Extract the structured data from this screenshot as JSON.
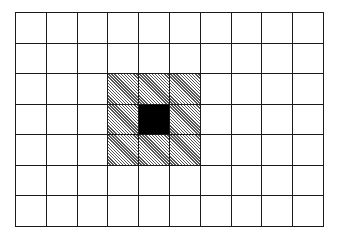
{
  "diagram": {
    "type": "grid",
    "columns": 10,
    "rows": 7,
    "line_color": "#1a1a1a",
    "background_color": "#ffffff",
    "filled_color": "#000000",
    "hatch_color": "#555555",
    "filled_cells": [
      {
        "row": 3,
        "col": 4
      }
    ],
    "hatched_cells": [
      {
        "row": 2,
        "col": 3
      },
      {
        "row": 2,
        "col": 4
      },
      {
        "row": 2,
        "col": 5
      },
      {
        "row": 3,
        "col": 3
      },
      {
        "row": 3,
        "col": 5
      },
      {
        "row": 4,
        "col": 3
      },
      {
        "row": 4,
        "col": 4
      },
      {
        "row": 4,
        "col": 5
      }
    ]
  }
}
